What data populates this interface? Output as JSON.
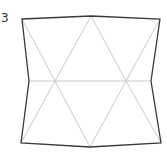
{
  "figure": {
    "label": "3",
    "colors": {
      "outline": "#3a3a3a",
      "inner": "#c4c4c4",
      "background": "#ffffff"
    },
    "outline_points": [
      [
        22,
        19
      ],
      [
        91,
        16
      ],
      [
        160,
        19
      ],
      [
        151,
        81
      ],
      [
        161,
        143
      ],
      [
        90,
        147
      ],
      [
        21,
        143
      ],
      [
        29,
        81
      ]
    ],
    "inner_lines": [
      [
        [
          29,
          81
        ],
        [
          151,
          81
        ]
      ],
      [
        [
          22,
          19
        ],
        [
          55,
          81
        ]
      ],
      [
        [
          55,
          81
        ],
        [
          91,
          16
        ]
      ],
      [
        [
          91,
          16
        ],
        [
          126,
          81
        ]
      ],
      [
        [
          126,
          81
        ],
        [
          160,
          19
        ]
      ],
      [
        [
          21,
          143
        ],
        [
          55,
          81
        ]
      ],
      [
        [
          55,
          81
        ],
        [
          90,
          147
        ]
      ],
      [
        [
          90,
          147
        ],
        [
          126,
          81
        ]
      ],
      [
        [
          126,
          81
        ],
        [
          161,
          143
        ]
      ]
    ]
  }
}
